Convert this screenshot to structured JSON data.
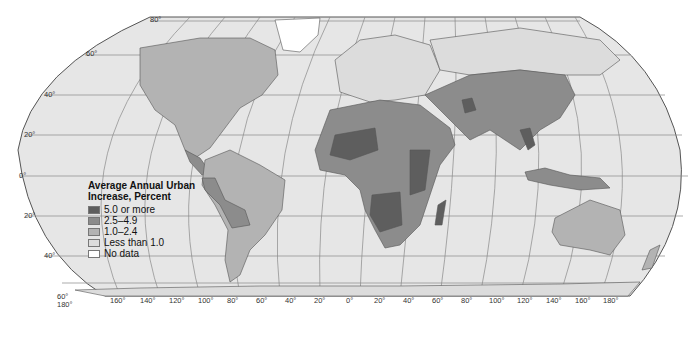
{
  "map": {
    "projection": "Robinson",
    "legend": {
      "title_line1": "Average Annual Urban",
      "title_line2": "Increase, Percent",
      "items": [
        {
          "label": "5.0 or more",
          "color": "#5e5e5e"
        },
        {
          "label": "2.5–4.9",
          "color": "#8c8c8c"
        },
        {
          "label": "1.0–2.4",
          "color": "#b3b3b3"
        },
        {
          "label": "Less than 1.0",
          "color": "#dcdcdc"
        },
        {
          "label": "No data",
          "color": "#ffffff"
        }
      ]
    },
    "latitude_labels": [
      "80°",
      "60°",
      "40°",
      "20°",
      "0°",
      "20°",
      "40°",
      "60°"
    ],
    "longitude_labels": [
      "180°",
      "160°",
      "140°",
      "120°",
      "100°",
      "80°",
      "60°",
      "40°",
      "20°",
      "0°",
      "20°",
      "40°",
      "60°",
      "80°",
      "100°",
      "120°",
      "140°",
      "160°",
      "180°"
    ],
    "colors": {
      "ocean": "#e6e6e6",
      "graticule": "#777777",
      "border": "#555555"
    }
  }
}
